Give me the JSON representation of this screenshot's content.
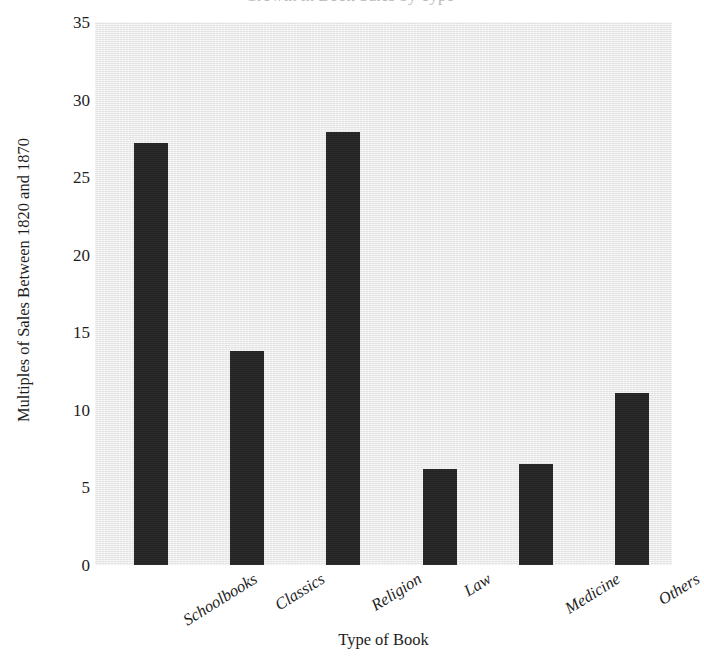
{
  "chart_data": {
    "type": "bar",
    "title": "Growth in Book Sales by Type",
    "title_clipped": true,
    "categories": [
      "Schoolbooks",
      "Classics",
      "Religion",
      "Law",
      "Medicine",
      "Others"
    ],
    "values": [
      27.2,
      13.8,
      27.9,
      6.2,
      6.5,
      11.1
    ],
    "xlabel": "Type of Book",
    "ylabel": "Multiples of Sales Between 1820 and 1870",
    "ylim": [
      0,
      35
    ],
    "yticks": [
      0,
      5,
      10,
      15,
      20,
      25,
      30,
      35
    ],
    "ytick_labels": [
      "0",
      "5",
      "10",
      "15",
      "20",
      "25",
      "30",
      "35"
    ],
    "grid": false,
    "legend": null,
    "bar_color": "#232323",
    "plot_background_color": "#e9e9e9",
    "page_background_color": "#ffffff",
    "text_color": "#1d1d1d",
    "xtick_rotation_degrees": -32
  }
}
